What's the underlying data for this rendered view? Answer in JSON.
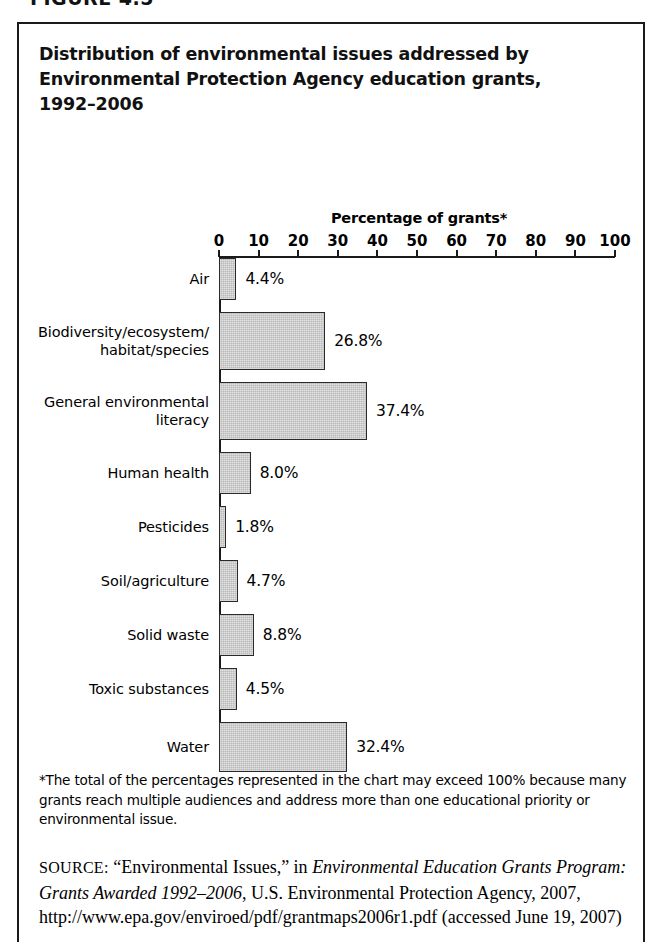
{
  "figure": {
    "label": "FIGURE 4.5",
    "title_lines": [
      "Distribution of environmental issues addressed by",
      "Environmental Protection Agency education grants,",
      "1992–2006"
    ]
  },
  "footnote": "*The total of the percentages represented in the chart may exceed 100% because many grants reach multiple audiences and address more than one educational priority or environmental issue.",
  "source": {
    "label": "SOURCE:",
    "part1": " “Environmental Issues,” in ",
    "italic1": "Environmental Education Grants Program: Grants Awarded 1992–2006",
    "part2": ", U.S. Environmental Protection Agency, 2007, http://www.epa.gov/enviroed/pdf/grantmaps2006r1.pdf (accessed June 19, 2007)"
  },
  "chart_data": {
    "type": "bar",
    "orientation": "horizontal",
    "title": "Distribution of environmental issues addressed by Environmental Protection Agency education grants, 1992–2006",
    "xlabel": "Percentage of grants*",
    "ylabel": "",
    "xlim": [
      0,
      100
    ],
    "grid": false,
    "legend": "none",
    "xticks": [
      0,
      10,
      20,
      30,
      40,
      50,
      60,
      70,
      80,
      90,
      100
    ],
    "xtick_labels": [
      "0",
      "10",
      "20",
      "30",
      "40",
      "50",
      "60",
      "70",
      "80",
      "90",
      "100"
    ],
    "categories": [
      "Air",
      "Biodiversity/ecosystem/habitat/species",
      "General environmental literacy",
      "Human health",
      "Pesticides",
      "Soil/agriculture",
      "Solid waste",
      "Toxic substances",
      "Water"
    ],
    "category_label_lines": [
      [
        "Air"
      ],
      [
        "Biodiversity/ecosystem/",
        "habitat/species"
      ],
      [
        "General environmental",
        "literacy"
      ],
      [
        "Human health"
      ],
      [
        "Pesticides"
      ],
      [
        "Soil/agriculture"
      ],
      [
        "Solid waste"
      ],
      [
        "Toxic substances"
      ],
      [
        "Water"
      ]
    ],
    "values": [
      4.4,
      26.8,
      37.4,
      8.0,
      1.8,
      4.7,
      8.8,
      4.5,
      32.4
    ],
    "value_labels": [
      "4.4%",
      "26.8%",
      "37.4%",
      "8.0%",
      "1.8%",
      "4.7%",
      "8.8%",
      "4.5%",
      "32.4%"
    ],
    "bar_color": "#b9b9b9",
    "bar_border_color": "#2a2a2a",
    "bar_thickness_px": [
      42,
      58,
      58,
      42,
      42,
      42,
      42,
      42,
      50
    ],
    "row_gap_px": [
      12,
      12,
      12,
      12,
      12,
      12,
      12,
      12
    ]
  }
}
